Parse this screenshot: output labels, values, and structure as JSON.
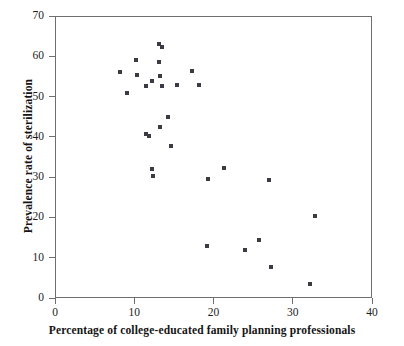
{
  "chart_data": {
    "type": "scatter",
    "title": "",
    "xlabel": "Percentage of college-educated family planning professionals",
    "ylabel": "Prevalence rate of sterilization",
    "xlim": [
      0,
      40
    ],
    "ylim": [
      0,
      70
    ],
    "xticks": [
      0,
      10,
      20,
      30,
      40
    ],
    "yticks": [
      0,
      10,
      20,
      30,
      40,
      50,
      60,
      70
    ],
    "grid": false,
    "legend": null,
    "marker": {
      "shape": "square",
      "color": "#3b3b44",
      "size_px": 4
    },
    "series": [
      {
        "name": "observations",
        "points": [
          [
            8.2,
            56.2
          ],
          [
            9.1,
            51.0
          ],
          [
            10.2,
            59.1
          ],
          [
            10.3,
            55.4
          ],
          [
            11.5,
            40.6
          ],
          [
            11.9,
            40.2
          ],
          [
            11.5,
            52.6
          ],
          [
            12.2,
            32.0
          ],
          [
            12.4,
            30.2
          ],
          [
            12.3,
            53.9
          ],
          [
            13.1,
            63.0
          ],
          [
            13.5,
            62.3
          ],
          [
            13.1,
            58.5
          ],
          [
            13.2,
            55.2
          ],
          [
            13.5,
            52.6
          ],
          [
            13.3,
            42.4
          ],
          [
            14.3,
            45.0
          ],
          [
            14.6,
            37.8
          ],
          [
            15.4,
            52.9
          ],
          [
            17.3,
            56.3
          ],
          [
            18.2,
            52.8
          ],
          [
            19.3,
            29.5
          ],
          [
            19.2,
            13.0
          ],
          [
            21.3,
            32.2
          ],
          [
            24.0,
            12.0
          ],
          [
            25.7,
            14.4
          ],
          [
            27.0,
            29.3
          ],
          [
            27.2,
            7.8
          ],
          [
            32.2,
            3.5
          ],
          [
            32.8,
            20.3
          ]
        ]
      }
    ]
  },
  "axes": {
    "x_tick_labels": [
      "0",
      "10",
      "20",
      "30",
      "40"
    ],
    "y_tick_labels": [
      "0",
      "10",
      "20",
      "30",
      "40",
      "50",
      "60",
      "70"
    ]
  },
  "colors": {
    "marker": "#3b3b44",
    "frame": "#6f6f6f",
    "text": "#141414",
    "background": "#ffffff"
  }
}
